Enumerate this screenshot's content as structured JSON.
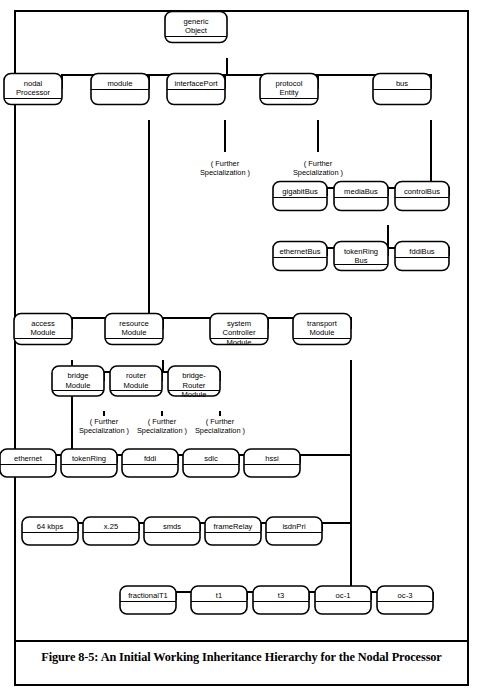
{
  "figure": {
    "caption": "Figure 8-5: An Initial Working Inheritance Hierarchy for the Nodal Processor",
    "title": "An Initial Working Inheritance Hierarchy for the Nodal Processor",
    "number": "Figure 8-5",
    "type": "inheritance-hierarchy-diagram"
  },
  "diagram": {
    "notation": "class boxes with name compartment and empty attribute compartment, connected by orthogonal generalization trees",
    "annotation_label": "( Further Specialization )",
    "root": "generic Object",
    "nodes": [
      {
        "id": "genericObject",
        "lines": [
          "generic",
          "Object"
        ],
        "x": 196,
        "y": 27,
        "w": 62,
        "h": 31
      },
      {
        "id": "nodalProcessor",
        "lines": [
          "nodal",
          "Processor"
        ],
        "x": 33,
        "y": 89,
        "w": 58,
        "h": 31
      },
      {
        "id": "module",
        "lines": [
          "module"
        ],
        "x": 120,
        "y": 89,
        "w": 58,
        "h": 31
      },
      {
        "id": "interfacePort",
        "lines": [
          "interfacePort"
        ],
        "x": 196,
        "y": 89,
        "w": 58,
        "h": 31
      },
      {
        "id": "protocolEntity",
        "lines": [
          "protocol",
          "Entity"
        ],
        "x": 289,
        "y": 89,
        "w": 58,
        "h": 31
      },
      {
        "id": "bus",
        "lines": [
          "bus"
        ],
        "x": 402,
        "y": 89,
        "w": 58,
        "h": 31
      },
      {
        "id": "gigabitBus",
        "lines": [
          "gigabitBus"
        ],
        "x": 300,
        "y": 196,
        "w": 54,
        "h": 29
      },
      {
        "id": "mediaBus",
        "lines": [
          "mediaBus"
        ],
        "x": 361,
        "y": 196,
        "w": 54,
        "h": 29
      },
      {
        "id": "controlBus",
        "lines": [
          "controlBus"
        ],
        "x": 422,
        "y": 196,
        "w": 54,
        "h": 29
      },
      {
        "id": "ethernetBus",
        "lines": [
          "ethernetBus"
        ],
        "x": 300,
        "y": 256,
        "w": 54,
        "h": 29
      },
      {
        "id": "tokenRingBus",
        "lines": [
          "tokenRing",
          "Bus"
        ],
        "x": 361,
        "y": 256,
        "w": 54,
        "h": 29
      },
      {
        "id": "fddiBus",
        "lines": [
          "fddiBus"
        ],
        "x": 422,
        "y": 256,
        "w": 54,
        "h": 29
      },
      {
        "id": "accessModule",
        "lines": [
          "access",
          "Module"
        ],
        "x": 43,
        "y": 329,
        "w": 58,
        "h": 31
      },
      {
        "id": "resourceModule",
        "lines": [
          "resource",
          "Module"
        ],
        "x": 134,
        "y": 329,
        "w": 58,
        "h": 31
      },
      {
        "id": "systemControllerModule",
        "lines": [
          "system",
          "Controller",
          "Module"
        ],
        "x": 239,
        "y": 329,
        "w": 58,
        "h": 31
      },
      {
        "id": "transportModule",
        "lines": [
          "transport",
          "Module"
        ],
        "x": 322,
        "y": 329,
        "w": 58,
        "h": 31
      },
      {
        "id": "bridgeModule",
        "lines": [
          "bridge",
          "Module"
        ],
        "x": 78,
        "y": 381,
        "w": 52,
        "h": 30
      },
      {
        "id": "routerModule",
        "lines": [
          "router",
          "Module"
        ],
        "x": 136,
        "y": 381,
        "w": 52,
        "h": 30
      },
      {
        "id": "bridgeRouterModule",
        "lines": [
          "bridge-",
          "Router",
          "Module"
        ],
        "x": 194,
        "y": 381,
        "w": 52,
        "h": 30
      },
      {
        "id": "ethernet",
        "lines": [
          "ethernet"
        ],
        "x": 28,
        "y": 463,
        "w": 56,
        "h": 28
      },
      {
        "id": "tokenRing",
        "lines": [
          "tokenRing"
        ],
        "x": 89,
        "y": 463,
        "w": 56,
        "h": 28
      },
      {
        "id": "fddi",
        "lines": [
          "fddi"
        ],
        "x": 150,
        "y": 463,
        "w": 56,
        "h": 28
      },
      {
        "id": "sdlc",
        "lines": [
          "sdlc"
        ],
        "x": 211,
        "y": 463,
        "w": 56,
        "h": 28
      },
      {
        "id": "hssi",
        "lines": [
          "hssi"
        ],
        "x": 272,
        "y": 463,
        "w": 56,
        "h": 28
      },
      {
        "id": "64kbps",
        "lines": [
          "64 kbps"
        ],
        "x": 50,
        "y": 531,
        "w": 56,
        "h": 28
      },
      {
        "id": "x25",
        "lines": [
          "x.25"
        ],
        "x": 111,
        "y": 531,
        "w": 56,
        "h": 28
      },
      {
        "id": "smds",
        "lines": [
          "smds"
        ],
        "x": 172,
        "y": 531,
        "w": 56,
        "h": 28
      },
      {
        "id": "frameRelay",
        "lines": [
          "frameRelay"
        ],
        "x": 233,
        "y": 531,
        "w": 56,
        "h": 28
      },
      {
        "id": "isdnPri",
        "lines": [
          "isdnPri"
        ],
        "x": 294,
        "y": 531,
        "w": 56,
        "h": 28
      },
      {
        "id": "fractionalT1",
        "lines": [
          "fractionalT1"
        ],
        "x": 148,
        "y": 600,
        "w": 56,
        "h": 28
      },
      {
        "id": "t1",
        "lines": [
          "t1"
        ],
        "x": 219,
        "y": 600,
        "w": 56,
        "h": 28
      },
      {
        "id": "t3",
        "lines": [
          "t3"
        ],
        "x": 281,
        "y": 600,
        "w": 56,
        "h": 28
      },
      {
        "id": "oc1",
        "lines": [
          "oc-1"
        ],
        "x": 343,
        "y": 600,
        "w": 56,
        "h": 28
      },
      {
        "id": "oc3",
        "lines": [
          "oc-3"
        ],
        "x": 405,
        "y": 600,
        "w": 56,
        "h": 28
      }
    ],
    "annotations": [
      {
        "id": "annot-interfacePort",
        "lines": [
          "( Further",
          "Specialization )"
        ],
        "x": 225,
        "y": 166
      },
      {
        "id": "annot-protocolEntity",
        "lines": [
          "( Further",
          "Specialization )"
        ],
        "x": 318,
        "y": 166
      },
      {
        "id": "annot-bridgeModule",
        "lines": [
          "( Further",
          "Specialization )"
        ],
        "x": 104,
        "y": 424
      },
      {
        "id": "annot-routerModule",
        "lines": [
          "( Further",
          "Specialization )"
        ],
        "x": 162,
        "y": 424
      },
      {
        "id": "annot-bridgeRouterModule",
        "lines": [
          "( Further",
          "Specialization )"
        ],
        "x": 220,
        "y": 424
      }
    ],
    "edges": [
      {
        "id": "edge-root-bus",
        "points": "227,58 227,75 62,75 62,89"
      },
      {
        "id": "edge-bus-1",
        "points": "62,75 149,75 149,89"
      },
      {
        "id": "edge-bus-2",
        "points": "149,75 225,75 225,89"
      },
      {
        "id": "edge-bus-3",
        "points": "225,75 318,75 318,89"
      },
      {
        "id": "edge-bus-4",
        "points": "318,75 431,75 431,89"
      },
      {
        "id": "edge-interfacePort-stub",
        "points": "225,120 225,152"
      },
      {
        "id": "edge-protocolEntity-stub",
        "points": "318,120 318,152"
      },
      {
        "id": "edge-bus-down",
        "points": "431,120 431,188 327,188 327,196"
      },
      {
        "id": "edge-busbar-1",
        "points": "327,188 388,188 388,196"
      },
      {
        "id": "edge-busbar-2",
        "points": "388,188 449,188 449,196"
      },
      {
        "id": "edge-mediaBus-down",
        "points": "388,225 388,248 327,248 327,256"
      },
      {
        "id": "edge-mediabar-1",
        "points": "327,248 388,248 388,256"
      },
      {
        "id": "edge-mediabar-2",
        "points": "388,248 449,248 449,256"
      },
      {
        "id": "edge-module-down",
        "points": "149,120 149,318 72,318 72,329"
      },
      {
        "id": "edge-modbar-1",
        "points": "72,318 163,318 163,329"
      },
      {
        "id": "edge-modbar-2",
        "points": "163,318 268,318 268,329"
      },
      {
        "id": "edge-modbar-3",
        "points": "268,318 351,318 351,329"
      },
      {
        "id": "edge-resource-down",
        "points": "163,360 163,372 104,372 104,381"
      },
      {
        "id": "edge-resbar-1",
        "points": "104,372 162,372 162,381"
      },
      {
        "id": "edge-resbar-2",
        "points": "162,372 220,372 220,381"
      },
      {
        "id": "edge-bridge-annot",
        "points": "104,411 104,416"
      },
      {
        "id": "edge-router-annot",
        "points": "162,411 162,416"
      },
      {
        "id": "edge-bridgerouter-annot",
        "points": "220,411 220,416"
      },
      {
        "id": "edge-access-down",
        "points": "72,360 72,455"
      },
      {
        "id": "edge-accbar-0",
        "points": "56,455 56,463"
      },
      {
        "id": "edge-accbar-main",
        "points": "56,455 300,455"
      },
      {
        "id": "edge-accbar-1",
        "points": "117,455 117,463"
      },
      {
        "id": "edge-accbar-2",
        "points": "178,455 178,463"
      },
      {
        "id": "edge-accbar-3",
        "points": "239,455 239,463"
      },
      {
        "id": "edge-accbar-4",
        "points": "300,455 300,463"
      },
      {
        "id": "edge-transport-down",
        "points": "351,360 351,592"
      },
      {
        "id": "edge-transport-tap1",
        "points": "300,455 351,455"
      },
      {
        "id": "edge-transport-tap2",
        "points": "78,523 351,523"
      },
      {
        "id": "edge-l5bar-0",
        "points": "78,523 78,531"
      },
      {
        "id": "edge-l5bar-1",
        "points": "139,523 139,531"
      },
      {
        "id": "edge-l5bar-2",
        "points": "200,523 200,531"
      },
      {
        "id": "edge-l5bar-3",
        "points": "261,523 261,531"
      },
      {
        "id": "edge-l5bar-4",
        "points": "322,523 322,531"
      },
      {
        "id": "edge-l6bar-main",
        "points": "176,592 433,592"
      },
      {
        "id": "edge-l6bar-0",
        "points": "176,592 176,600"
      },
      {
        "id": "edge-l6bar-1",
        "points": "247,592 247,600"
      },
      {
        "id": "edge-l6bar-2",
        "points": "309,592 309,600"
      },
      {
        "id": "edge-l6bar-3",
        "points": "371,592 371,600"
      },
      {
        "id": "edge-l6bar-4",
        "points": "433,592 433,600"
      }
    ]
  }
}
